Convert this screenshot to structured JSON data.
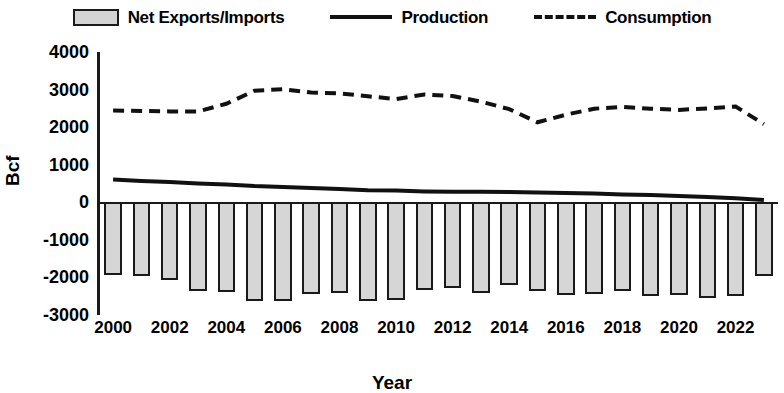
{
  "legend": {
    "items": [
      {
        "label": "Net Exports/Imports",
        "marker": "bar-swatch-icon"
      },
      {
        "label": "Production",
        "marker": "solid-line-icon"
      },
      {
        "label": "Consumption",
        "marker": "dashed-line-icon"
      }
    ]
  },
  "axes": {
    "ylabel": "Bcf",
    "xlabel": "Year",
    "yticks": [
      "4000",
      "3000",
      "2000",
      "1000",
      "0",
      "-1000",
      "-2000",
      "-3000"
    ],
    "xticks": [
      "2000",
      "2002",
      "2004",
      "2006",
      "2008",
      "2010",
      "2012",
      "2014",
      "2016",
      "2018",
      "2020",
      "2022"
    ]
  },
  "colors": {
    "bar_fill": "#d6d6d6",
    "bar_stroke": "#1a1a1a",
    "production_line": "#111111",
    "consumption_line": "#111111",
    "axis": "#1a1a1a",
    "background": "#ffffff"
  },
  "chart_data": {
    "type": "bar",
    "title": "",
    "xlabel": "Year",
    "ylabel": "Bcf",
    "ylim": [
      -3000,
      4000
    ],
    "ytick_step": 1000,
    "grid": false,
    "legend_position": "top",
    "x": [
      2000,
      2001,
      2002,
      2003,
      2004,
      2005,
      2006,
      2007,
      2008,
      2009,
      2010,
      2011,
      2012,
      2013,
      2014,
      2015,
      2016,
      2017,
      2018,
      2019,
      2020,
      2021,
      2022,
      2023
    ],
    "categories": [
      "2000",
      "2001",
      "2002",
      "2003",
      "2004",
      "2005",
      "2006",
      "2007",
      "2008",
      "2009",
      "2010",
      "2011",
      "2012",
      "2013",
      "2014",
      "2015",
      "2016",
      "2017",
      "2018",
      "2019",
      "2020",
      "2021",
      "2022",
      "2023"
    ],
    "series": [
      {
        "name": "Net Exports/Imports",
        "kind": "bar",
        "values": [
          -1930,
          -1960,
          -2060,
          -2350,
          -2380,
          -2630,
          -2630,
          -2450,
          -2420,
          -2620,
          -2600,
          -2340,
          -2290,
          -2420,
          -2190,
          -2350,
          -2480,
          -2430,
          -2370,
          -2500,
          -2480,
          -2550,
          -2500,
          -1950
        ]
      },
      {
        "name": "Production",
        "kind": "line",
        "style": "solid",
        "values": [
          610,
          570,
          540,
          500,
          470,
          430,
          410,
          380,
          350,
          320,
          310,
          290,
          280,
          280,
          270,
          260,
          250,
          230,
          210,
          190,
          170,
          140,
          110,
          60
        ]
      },
      {
        "name": "Consumption",
        "kind": "line",
        "style": "dashed",
        "values": [
          2440,
          2430,
          2420,
          2420,
          2620,
          2970,
          3010,
          2920,
          2900,
          2820,
          2750,
          2870,
          2830,
          2680,
          2480,
          2130,
          2330,
          2490,
          2540,
          2490,
          2460,
          2500,
          2550,
          2080
        ]
      }
    ]
  }
}
